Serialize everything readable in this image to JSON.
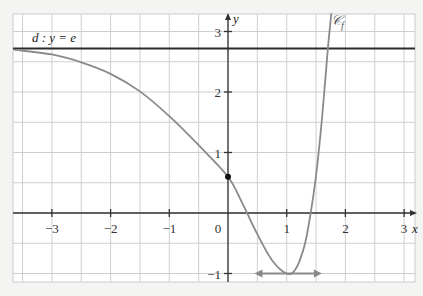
{
  "chart_data": {
    "type": "line",
    "title": "",
    "xlabel": "x",
    "ylabel": "y",
    "xlim": [
      -3.65,
      3.2
    ],
    "ylim": [
      -1.15,
      3.3
    ],
    "grid": true,
    "grid_step": 0.5,
    "x_ticks": [
      {
        "value": -3,
        "label": "−3"
      },
      {
        "value": -2,
        "label": "−2"
      },
      {
        "value": -1,
        "label": "−1"
      },
      {
        "value": 0,
        "label": "0"
      },
      {
        "value": 1,
        "label": "1"
      },
      {
        "value": 2,
        "label": "2"
      },
      {
        "value": 3,
        "label": "3"
      }
    ],
    "y_ticks": [
      {
        "value": -1,
        "label": "−1"
      },
      {
        "value": 1,
        "label": "1"
      },
      {
        "value": 2,
        "label": "2"
      },
      {
        "value": 3,
        "label": "3"
      }
    ],
    "series": [
      {
        "name": "𝒞f",
        "label": "𝒞f",
        "color": "#8a8a8a",
        "points": [
          [
            -3.65,
            2.7
          ],
          [
            -3.0,
            2.62
          ],
          [
            -2.5,
            2.49
          ],
          [
            -2.0,
            2.3
          ],
          [
            -1.5,
            2.01
          ],
          [
            -1.0,
            1.6
          ],
          [
            -0.5,
            1.12
          ],
          [
            0.0,
            0.6
          ],
          [
            0.25,
            0.15
          ],
          [
            0.5,
            -0.35
          ],
          [
            0.75,
            -0.78
          ],
          [
            1.0,
            -1.0
          ],
          [
            1.15,
            -0.93
          ],
          [
            1.3,
            -0.55
          ],
          [
            1.4,
            -0.05
          ],
          [
            1.5,
            0.62
          ],
          [
            1.6,
            1.55
          ],
          [
            1.7,
            2.7
          ],
          [
            1.76,
            3.3
          ]
        ]
      },
      {
        "name": "d",
        "label": "d : y = e",
        "color": "#2a2a2a",
        "type": "hline",
        "y": 2.718
      }
    ],
    "annotations": [
      {
        "type": "point",
        "x": 0,
        "y": 0.6,
        "label": ""
      },
      {
        "type": "horizontal_tangent",
        "x_from": 0.45,
        "x_to": 1.6,
        "y": -1,
        "color": "#8a8a8a"
      }
    ],
    "legend": "none"
  },
  "labels": {
    "line_d": "d : y = e",
    "curve": "𝒞",
    "curve_sub": "f",
    "axis_x": "x",
    "axis_y": "y",
    "origin": "0"
  }
}
